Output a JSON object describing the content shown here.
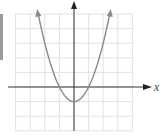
{
  "chart_data": {
    "type": "line",
    "title": "",
    "xlabel": "x",
    "ylabel": "",
    "function": "y = x^2 - 1",
    "grid": true,
    "xlim": [
      -4,
      4
    ],
    "ylim": [
      -3,
      5
    ],
    "x": [
      -2.45,
      -2,
      -1.5,
      -1,
      -0.5,
      0,
      0.5,
      1,
      1.5,
      2,
      2.45
    ],
    "series": [
      {
        "name": "parabola",
        "values": [
          5,
          3,
          1.25,
          0,
          -0.75,
          -1,
          -0.75,
          0,
          1.25,
          3,
          5
        ]
      }
    ],
    "vertex": [
      0,
      -1
    ],
    "x_intercepts": [
      -1,
      1
    ]
  },
  "colors": {
    "grid": "#e2e2e2",
    "axes": "#333333",
    "curve": "#8a8a8a",
    "edge_bar": "#9a9a9a"
  },
  "labels": {
    "x_axis": "x"
  }
}
